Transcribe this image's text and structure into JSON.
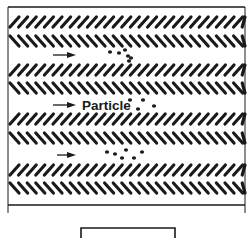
{
  "diagram": {
    "title": "",
    "frame": {
      "left": 8,
      "right": 245,
      "top": 7,
      "bottom": 205,
      "side_extent": 213
    },
    "hatch_rows": [
      {
        "y": 22,
        "direction": "/"
      },
      {
        "y": 41,
        "direction": "\\"
      },
      {
        "y": 70,
        "direction": "/"
      },
      {
        "y": 88,
        "direction": "\\"
      },
      {
        "y": 119,
        "direction": "/"
      },
      {
        "y": 138,
        "direction": "\\"
      },
      {
        "y": 170,
        "direction": "/"
      },
      {
        "y": 188,
        "direction": "\\"
      }
    ],
    "channels": [
      {
        "arrow": {
          "x1": 53,
          "x2": 76,
          "y": 55
        },
        "label": "",
        "particles": [
          [
            110,
            52
          ],
          [
            119,
            53
          ],
          [
            125,
            50
          ],
          [
            128,
            56
          ],
          [
            129,
            61
          ],
          [
            131,
            58
          ]
        ]
      },
      {
        "arrow": {
          "x1": 53,
          "x2": 76,
          "y": 105
        },
        "label": "Particle",
        "particles": [
          [
            130,
            100
          ],
          [
            143,
            100
          ],
          [
            138,
            109
          ],
          [
            154,
            106
          ]
        ]
      },
      {
        "arrow": {
          "x1": 57,
          "x2": 76,
          "y": 155
        },
        "label": "",
        "particles": [
          [
            107,
            152
          ],
          [
            115,
            154
          ],
          [
            126,
            150
          ],
          [
            122,
            158
          ],
          [
            134,
            158
          ],
          [
            142,
            152
          ]
        ]
      }
    ],
    "bottom_box": {
      "x": 81,
      "y": 228,
      "width": 94
    },
    "colors": {
      "ink": "#1a1a1a",
      "background": "#ffffff"
    }
  }
}
